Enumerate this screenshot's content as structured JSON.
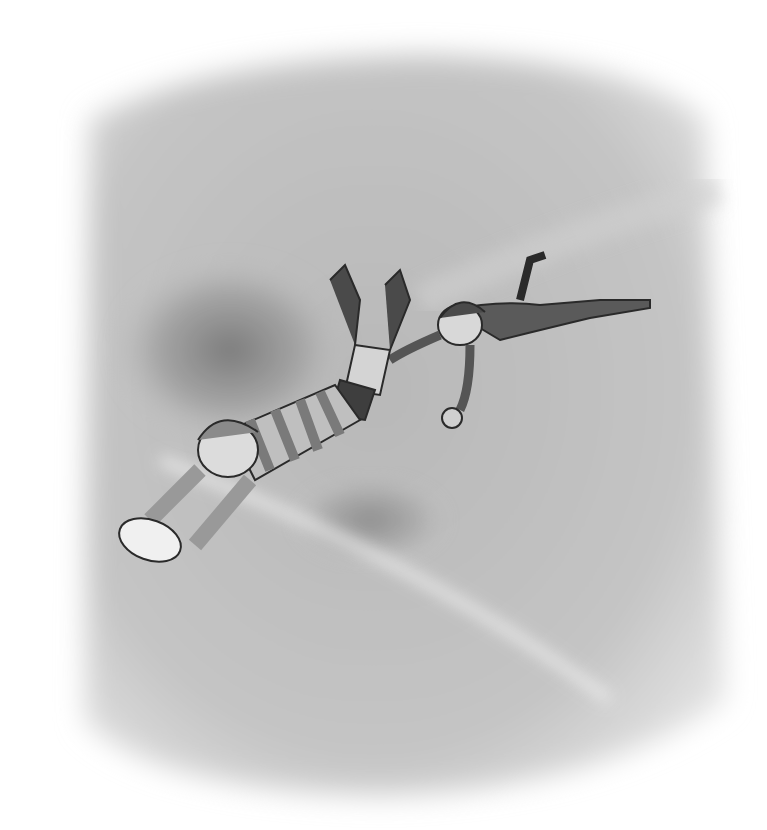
{
  "image": {
    "description": "Grayscale pencil illustration of two children playing rugby: a boy in a striped jersey dives to ground the ball while another player dives behind grabbing at his leg",
    "palette": {
      "background": "#ffffff",
      "field": "#bdbdbd",
      "field_dark": "#8a8a8a",
      "ink": "#2a2a2a",
      "highlight": "#ececec"
    }
  }
}
